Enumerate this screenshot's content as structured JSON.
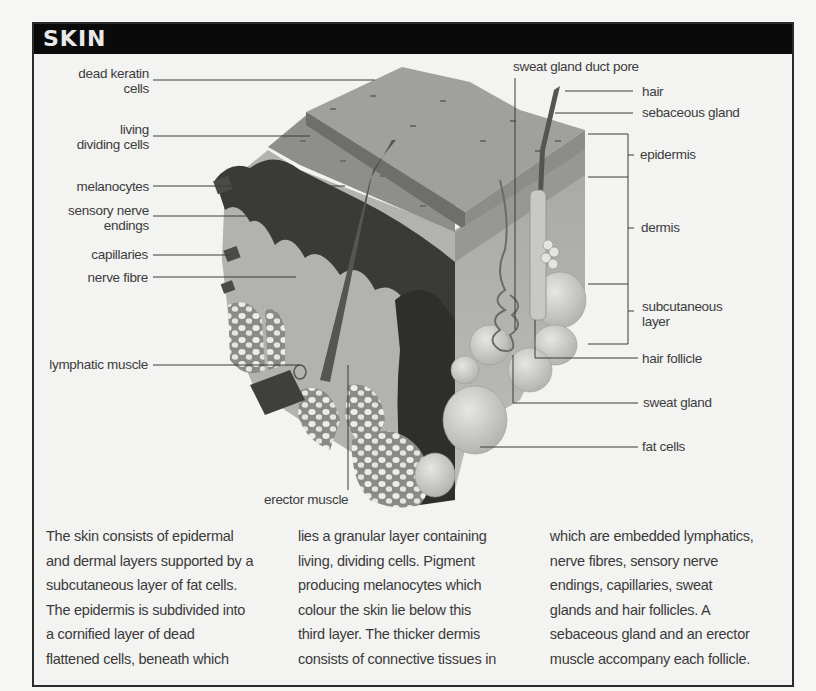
{
  "title": "SKIN",
  "labels_left": [
    {
      "id": "dead-keratin-cells",
      "text": "dead keratin\ncells"
    },
    {
      "id": "living-dividing-cells",
      "text": "living\ndividing cells"
    },
    {
      "id": "melanocytes",
      "text": "melanocytes"
    },
    {
      "id": "sensory-nerve-endings",
      "text": "sensory nerve\nendings"
    },
    {
      "id": "capillaries",
      "text": "capillaries"
    },
    {
      "id": "nerve-fibre",
      "text": "nerve fibre"
    },
    {
      "id": "lymphatic-muscle",
      "text": "lymphatic muscle"
    }
  ],
  "labels_top": [
    {
      "id": "sweat-gland-duct-pore",
      "text": "sweat gland duct pore"
    }
  ],
  "labels_right": [
    {
      "id": "hair",
      "text": "hair"
    },
    {
      "id": "sebaceous-gland",
      "text": "sebaceous gland"
    },
    {
      "id": "epidermis",
      "text": "epidermis"
    },
    {
      "id": "dermis",
      "text": "dermis"
    },
    {
      "id": "subcutaneous-layer",
      "text": "subcutaneous\nlayer"
    },
    {
      "id": "hair-follicle",
      "text": "hair follicle"
    },
    {
      "id": "sweat-gland",
      "text": "sweat gland"
    },
    {
      "id": "fat-cells",
      "text": "fat cells"
    }
  ],
  "labels_bottom": [
    {
      "id": "erector-muscle",
      "text": "erector muscle"
    }
  ],
  "caption": {
    "col1": "The skin consists of epidermal\nand dermal layers supported by a\nsubcutaneous layer of fat cells.\nThe epidermis is subdivided into\na cornified layer of dead\nflattened cells, beneath which",
    "col2": "lies a granular layer containing\nliving, dividing cells. Pigment\nproducing melanocytes which\ncolour the skin lie below this\nthird layer. The thicker dermis\nconsists of connective tissues in",
    "col3": "which are embedded lymphatics,\nnerve fibres, sensory nerve\nendings, capillaries, sweat\nglands and hair follicles. A\nsebaceous gland and an erector\nmuscle accompany each follicle."
  },
  "colors": {
    "title_bar": "#0a0a0a",
    "title_text": "#e9e9e9",
    "frame_border": "#2b2b2b",
    "background": "#f3f3f1",
    "label_text": "#3c3c3c"
  }
}
